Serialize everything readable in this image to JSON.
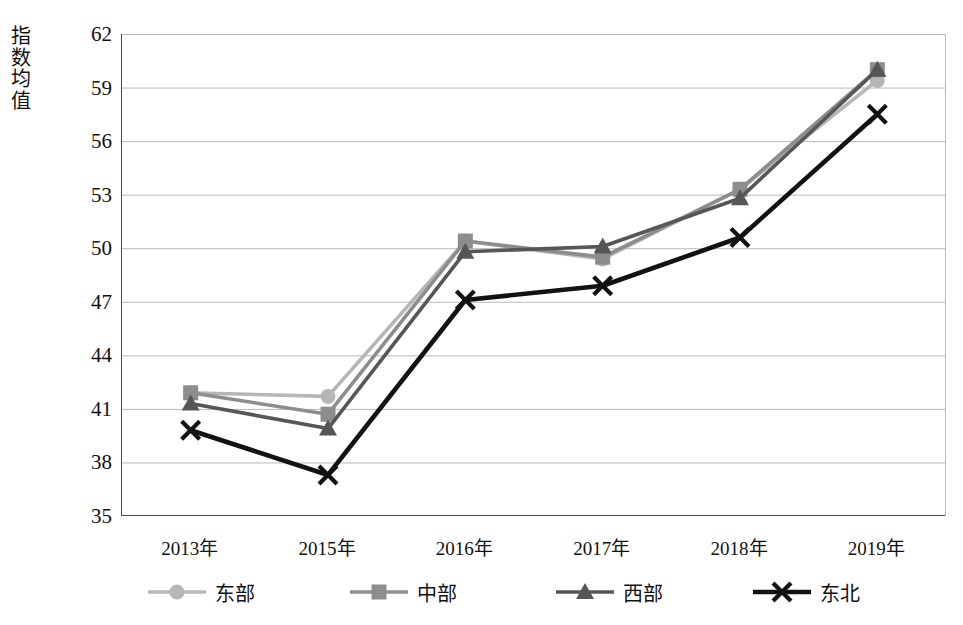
{
  "chart_data": {
    "type": "line",
    "title": "",
    "xlabel": "",
    "ylabel": "指数均值",
    "categories": [
      "2013年",
      "2015年",
      "2016年",
      "2017年",
      "2018年",
      "2019年"
    ],
    "ylim": [
      35,
      62
    ],
    "y_ticks": [
      62,
      59,
      56,
      53,
      50,
      47,
      44,
      41,
      38,
      35
    ],
    "grid": true,
    "legend_position": "bottom",
    "series": [
      {
        "name": "东部",
        "marker": "circle",
        "color": "#b6b6b6",
        "values": [
          41.9,
          41.7,
          50.4,
          49.4,
          53.3,
          59.4
        ]
      },
      {
        "name": "中部",
        "marker": "square",
        "color": "#8d8d8d",
        "values": [
          41.9,
          40.7,
          50.4,
          49.5,
          53.3,
          60.0
        ]
      },
      {
        "name": "西部",
        "marker": "triangle",
        "color": "#565656",
        "values": [
          41.3,
          39.9,
          49.8,
          50.1,
          52.8,
          60.0
        ]
      },
      {
        "name": "东北",
        "marker": "cross",
        "color": "#121212",
        "values": [
          39.8,
          37.3,
          47.1,
          47.9,
          50.6,
          57.5
        ]
      }
    ]
  },
  "axis_colors": {
    "frame": "#4d4d4d",
    "grid": "#b9b9b9",
    "text": "#111111"
  }
}
